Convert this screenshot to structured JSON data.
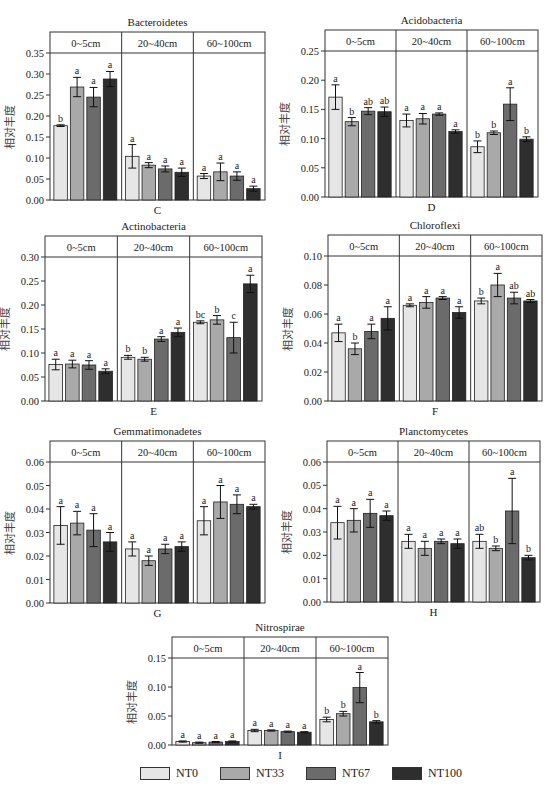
{
  "figure": {
    "y_axis_label": "相对丰度",
    "depth_groups": [
      "0~5cm",
      "20~40cm",
      "60~100cm"
    ],
    "treatments": [
      "NT0",
      "NT33",
      "NT67",
      "NT100"
    ]
  },
  "legend": {
    "items": [
      {
        "label": "NT0",
        "color": "#e6e6e6"
      },
      {
        "label": "NT33",
        "color": "#a9a9a9"
      },
      {
        "label": "NT67",
        "color": "#6b6b6b"
      },
      {
        "label": "NT100",
        "color": "#2e2e2e"
      }
    ]
  },
  "chart_data": [
    {
      "type": "bar",
      "panel": "C",
      "title": "Bacteroidetes",
      "xlabel": "C",
      "ylabel": "相对丰度",
      "ylim": [
        0,
        0.35
      ],
      "yticks": [
        "0.00",
        "0.05",
        "0.10",
        "0.15",
        "0.20",
        "0.25",
        "0.30",
        "0.35"
      ],
      "categories": [
        "0~5cm",
        "20~40cm",
        "60~100cm"
      ],
      "series": [
        {
          "name": "NT0",
          "values": [
            0.177,
            0.104,
            0.057
          ],
          "errors": [
            0.002,
            0.028,
            0.006
          ],
          "letters": [
            "b",
            "a",
            "a"
          ]
        },
        {
          "name": "NT33",
          "values": [
            0.269,
            0.083,
            0.067
          ],
          "errors": [
            0.023,
            0.006,
            0.021
          ],
          "letters": [
            "a",
            "a",
            "a"
          ]
        },
        {
          "name": "NT67",
          "values": [
            0.245,
            0.074,
            0.057
          ],
          "errors": [
            0.023,
            0.007,
            0.01
          ],
          "letters": [
            "a",
            "a",
            "a"
          ]
        },
        {
          "name": "NT100",
          "values": [
            0.288,
            0.066,
            0.027
          ],
          "errors": [
            0.018,
            0.01,
            0.006
          ],
          "letters": [
            "a",
            "a",
            "a"
          ]
        }
      ]
    },
    {
      "type": "bar",
      "panel": "D",
      "title": "Acidobacteria",
      "xlabel": "D",
      "ylabel": "相对丰度",
      "ylim": [
        0,
        0.25
      ],
      "yticks": [
        "0.00",
        "0.05",
        "0.10",
        "0.15",
        "0.20",
        "0.25"
      ],
      "categories": [
        "0~5cm",
        "20~40cm",
        "60~100cm"
      ],
      "series": [
        {
          "name": "NT0",
          "values": [
            0.171,
            0.131,
            0.086
          ],
          "errors": [
            0.021,
            0.011,
            0.01
          ],
          "letters": [
            "a",
            "a",
            "b"
          ]
        },
        {
          "name": "NT33",
          "values": [
            0.129,
            0.134,
            0.11
          ],
          "errors": [
            0.007,
            0.009,
            0.003
          ],
          "letters": [
            "b",
            "a",
            "b"
          ]
        },
        {
          "name": "NT67",
          "values": [
            0.147,
            0.142,
            0.159
          ],
          "errors": [
            0.006,
            0.002,
            0.028
          ],
          "letters": [
            "ab",
            "a",
            "a"
          ]
        },
        {
          "name": "NT100",
          "values": [
            0.146,
            0.112,
            0.099
          ],
          "errors": [
            0.008,
            0.003,
            0.004
          ],
          "letters": [
            "ab",
            "a",
            "b"
          ]
        }
      ]
    },
    {
      "type": "bar",
      "panel": "E",
      "title": "Actinobacteria",
      "xlabel": "E",
      "ylabel": "相对丰度",
      "ylim": [
        0,
        0.3
      ],
      "yticks": [
        "0.00",
        "0.05",
        "0.10",
        "0.15",
        "0.20",
        "0.25",
        "0.30"
      ],
      "categories": [
        "0~5cm",
        "20~40cm",
        "60~100cm"
      ],
      "series": [
        {
          "name": "NT0",
          "values": [
            0.076,
            0.091,
            0.164
          ],
          "errors": [
            0.011,
            0.004,
            0.003
          ],
          "letters": [
            "a",
            "b",
            "bc"
          ]
        },
        {
          "name": "NT33",
          "values": [
            0.077,
            0.087,
            0.169
          ],
          "errors": [
            0.008,
            0.004,
            0.009
          ],
          "letters": [
            "a",
            "b",
            "b"
          ]
        },
        {
          "name": "NT67",
          "values": [
            0.075,
            0.129,
            0.132
          ],
          "errors": [
            0.009,
            0.005,
            0.032
          ],
          "letters": [
            "a",
            "a",
            "c"
          ]
        },
        {
          "name": "NT100",
          "values": [
            0.062,
            0.143,
            0.244
          ],
          "errors": [
            0.005,
            0.009,
            0.018
          ],
          "letters": [
            "a",
            "a",
            "a"
          ]
        }
      ]
    },
    {
      "type": "bar",
      "panel": "F",
      "title": "Chloroflexi",
      "xlabel": "F",
      "ylabel": "相对丰度",
      "ylim": [
        0,
        0.1
      ],
      "yticks": [
        "0.00",
        "0.02",
        "0.04",
        "0.06",
        "0.08",
        "0.10"
      ],
      "categories": [
        "0~5cm",
        "20~40cm",
        "60~100cm"
      ],
      "series": [
        {
          "name": "NT0",
          "values": [
            0.047,
            0.066,
            0.069
          ],
          "errors": [
            0.006,
            0.001,
            0.002
          ],
          "letters": [
            "a",
            "a",
            "b"
          ]
        },
        {
          "name": "NT33",
          "values": [
            0.036,
            0.068,
            0.08
          ],
          "errors": [
            0.004,
            0.004,
            0.008
          ],
          "letters": [
            "b",
            "a",
            "a"
          ]
        },
        {
          "name": "NT67",
          "values": [
            0.048,
            0.071,
            0.071
          ],
          "errors": [
            0.005,
            0.001,
            0.004
          ],
          "letters": [
            "a",
            "a",
            "ab"
          ]
        },
        {
          "name": "NT100",
          "values": [
            0.057,
            0.061,
            0.069
          ],
          "errors": [
            0.008,
            0.004,
            0.001
          ],
          "letters": [
            "a",
            "a",
            "ab"
          ]
        }
      ]
    },
    {
      "type": "bar",
      "panel": "G",
      "title": "Gemmatimonadetes",
      "xlabel": "G",
      "ylabel": "相对丰度",
      "ylim": [
        0,
        0.06
      ],
      "yticks": [
        "0.00",
        "0.01",
        "0.02",
        "0.03",
        "0.04",
        "0.05",
        "0.06"
      ],
      "categories": [
        "0~5cm",
        "20~40cm",
        "60~100cm"
      ],
      "series": [
        {
          "name": "NT0",
          "values": [
            0.033,
            0.023,
            0.035
          ],
          "errors": [
            0.008,
            0.003,
            0.006
          ],
          "letters": [
            "a",
            "a",
            "a"
          ]
        },
        {
          "name": "NT33",
          "values": [
            0.034,
            0.018,
            0.043
          ],
          "errors": [
            0.005,
            0.002,
            0.007
          ],
          "letters": [
            "a",
            "a",
            "a"
          ]
        },
        {
          "name": "NT67",
          "values": [
            0.031,
            0.023,
            0.042
          ],
          "errors": [
            0.007,
            0.002,
            0.004
          ],
          "letters": [
            "a",
            "a",
            "a"
          ]
        },
        {
          "name": "NT100",
          "values": [
            0.026,
            0.024,
            0.041
          ],
          "errors": [
            0.004,
            0.002,
            0.001
          ],
          "letters": [
            "a",
            "a",
            "a"
          ]
        }
      ]
    },
    {
      "type": "bar",
      "panel": "H",
      "title": "Planctomycetes",
      "xlabel": "H",
      "ylabel": "相对丰度",
      "ylim": [
        0,
        0.06
      ],
      "yticks": [
        "0.00",
        "0.01",
        "0.02",
        "0.03",
        "0.04",
        "0.05",
        "0.06"
      ],
      "categories": [
        "0~5cm",
        "20~40cm",
        "60~100cm"
      ],
      "series": [
        {
          "name": "NT0",
          "values": [
            0.034,
            0.026,
            0.026
          ],
          "errors": [
            0.007,
            0.003,
            0.003
          ],
          "letters": [
            "a",
            "a",
            "ab"
          ]
        },
        {
          "name": "NT33",
          "values": [
            0.035,
            0.023,
            0.023
          ],
          "errors": [
            0.005,
            0.003,
            0.001
          ],
          "letters": [
            "a",
            "a",
            "b"
          ]
        },
        {
          "name": "NT67",
          "values": [
            0.038,
            0.026,
            0.039
          ],
          "errors": [
            0.006,
            0.001,
            0.014
          ],
          "letters": [
            "a",
            "a",
            "a"
          ]
        },
        {
          "name": "NT100",
          "values": [
            0.037,
            0.025,
            0.019
          ],
          "errors": [
            0.002,
            0.002,
            0.001
          ],
          "letters": [
            "a",
            "a",
            "b"
          ]
        }
      ]
    },
    {
      "type": "bar",
      "panel": "I",
      "title": "Nitrospirae",
      "xlabel": "I",
      "ylabel": "相对丰度",
      "ylim": [
        0,
        0.15
      ],
      "yticks": [
        "0.00",
        "0.05",
        "0.10",
        "0.15"
      ],
      "categories": [
        "0~5cm",
        "20~40cm",
        "60~100cm"
      ],
      "series": [
        {
          "name": "NT0",
          "values": [
            0.006,
            0.025,
            0.044
          ],
          "errors": [
            0.001,
            0.002,
            0.004
          ],
          "letters": [
            "a",
            "a",
            "b"
          ]
        },
        {
          "name": "NT33",
          "values": [
            0.004,
            0.025,
            0.054
          ],
          "errors": [
            0.001,
            0.001,
            0.004
          ],
          "letters": [
            "a",
            "a",
            "b"
          ]
        },
        {
          "name": "NT67",
          "values": [
            0.005,
            0.023,
            0.099
          ],
          "errors": [
            0.001,
            0.001,
            0.026
          ],
          "letters": [
            "a",
            "a",
            "a"
          ]
        },
        {
          "name": "NT100",
          "values": [
            0.006,
            0.022,
            0.04
          ],
          "errors": [
            0.001,
            0.001,
            0.002
          ],
          "letters": [
            "a",
            "a",
            "b"
          ]
        }
      ]
    }
  ]
}
